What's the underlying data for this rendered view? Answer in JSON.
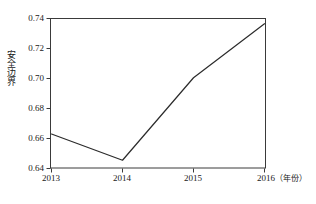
{
  "chart_data": {
    "type": "line",
    "title": "",
    "xlabel": "年份",
    "ylabel": "安全边界",
    "x": [
      2013,
      2014,
      2015,
      2016
    ],
    "categories": [
      "2013",
      "2014",
      "2015",
      "2016"
    ],
    "values": [
      0.663,
      0.6455,
      0.7005,
      0.7365
    ],
    "series": [
      {
        "name": "安全边界",
        "values": [
          0.663,
          0.6455,
          0.7005,
          0.7365
        ]
      }
    ],
    "xlim": [
      2013,
      2016
    ],
    "ylim": [
      0.64,
      0.74
    ],
    "yticks": [
      0.64,
      0.66,
      0.68,
      0.7,
      0.72,
      0.74
    ],
    "ytick_labels": [
      "0.64",
      "0.66",
      "0.68",
      "0.70",
      "0.72",
      "0.74"
    ],
    "xticks": [
      2013,
      2014,
      2015,
      2016
    ],
    "xtick_labels": [
      "2013",
      "2014",
      "2015",
      "2016"
    ],
    "grid": false,
    "legend": false,
    "line_color": "#2b2b2b",
    "frame_color": "#3a3a3a",
    "background": "#ffffff"
  },
  "axis": {
    "y_title": "安全边界",
    "x_unit_label": "（年份）",
    "y_labels": [
      "0.74",
      "0.72",
      "0.70",
      "0.68",
      "0.66",
      "0.64"
    ],
    "x_labels": [
      "2013",
      "2014",
      "2015",
      "2016"
    ]
  }
}
